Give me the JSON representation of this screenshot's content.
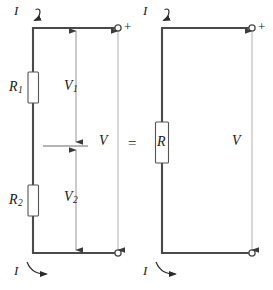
{
  "figure": {
    "kind": "circuit-diagram",
    "stroke_color": "#3c3c3c",
    "wire_color": "#4a4a4a",
    "text_color": "#1a1a1a",
    "background": "#ffffff"
  },
  "left_circuit": {
    "name": "series-resistor-circuit",
    "resistor1": {
      "label": "R",
      "sub": "1"
    },
    "resistor2": {
      "label": "R",
      "sub": "2"
    },
    "voltage1": {
      "label": "V",
      "sub": "1"
    },
    "voltage2": {
      "label": "V",
      "sub": "2"
    },
    "total_voltage": {
      "label": "V"
    },
    "current_top": {
      "label": "I"
    },
    "current_bottom": {
      "label": "I"
    },
    "terminal_positive": {
      "label": "+"
    },
    "terminal_negative": {
      "label": ""
    }
  },
  "equals": {
    "label": "="
  },
  "right_circuit": {
    "name": "equivalent-resistor-circuit",
    "resistor": {
      "label": "R"
    },
    "total_voltage": {
      "label": "V"
    },
    "current_top": {
      "label": "I"
    },
    "current_bottom": {
      "label": "I"
    },
    "terminal_positive": {
      "label": "+"
    },
    "terminal_negative": {
      "label": ""
    }
  }
}
